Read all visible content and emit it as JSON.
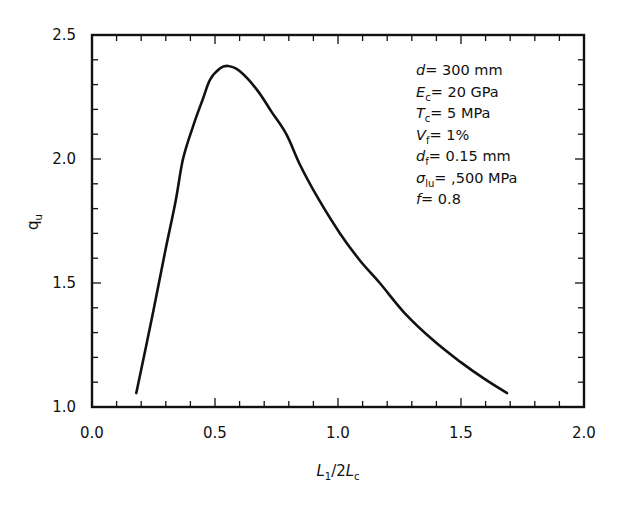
{
  "chart_data": {
    "type": "line",
    "title": "",
    "xlabel": "L1/2Lc",
    "ylabel": "qu",
    "xlim": [
      0.0,
      2.0
    ],
    "ylim": [
      1.0,
      2.5
    ],
    "grid": false,
    "x_ticks": [
      "0.0",
      "0.5",
      "1.0",
      "1.5",
      "2.0"
    ],
    "y_ticks": [
      "1.0",
      "1.5",
      "2.0",
      "2.5"
    ],
    "x_minor_step": 0.1,
    "y_minor_step": 0.1,
    "series": [
      {
        "name": "qu",
        "color": "#111111",
        "x": [
          0.18,
          0.25,
          0.3,
          0.34,
          0.37,
          0.41,
          0.45,
          0.48,
          0.52,
          0.553,
          0.6,
          0.67,
          0.73,
          0.79,
          0.846,
          0.92,
          1.008,
          1.09,
          1.17,
          1.27,
          1.386,
          1.5,
          1.6,
          1.687
        ],
        "y": [
          1.056,
          1.39,
          1.64,
          1.83,
          2.0,
          2.13,
          2.24,
          2.32,
          2.365,
          2.375,
          2.355,
          2.28,
          2.19,
          2.1,
          1.976,
          1.84,
          1.7,
          1.59,
          1.5,
          1.38,
          1.27,
          1.18,
          1.11,
          1.056
        ]
      }
    ],
    "annotations": [
      {
        "sym": "d",
        "sub": "",
        "value": "= 300 mm"
      },
      {
        "sym": "E",
        "sub": "c",
        "value": "= 20 GPa"
      },
      {
        "sym": "T",
        "sub": "c",
        "value": "= 5 MPa"
      },
      {
        "sym": "V",
        "sub": "f",
        "value": "= 1%"
      },
      {
        "sym": "d",
        "sub": "f",
        "value": "= 0.15 mm"
      },
      {
        "sym": "σ",
        "sub": "lu",
        "value": "= ,500 MPa"
      },
      {
        "sym": "f",
        "sub": "",
        "value": "= 0.8"
      }
    ],
    "legend": null
  }
}
